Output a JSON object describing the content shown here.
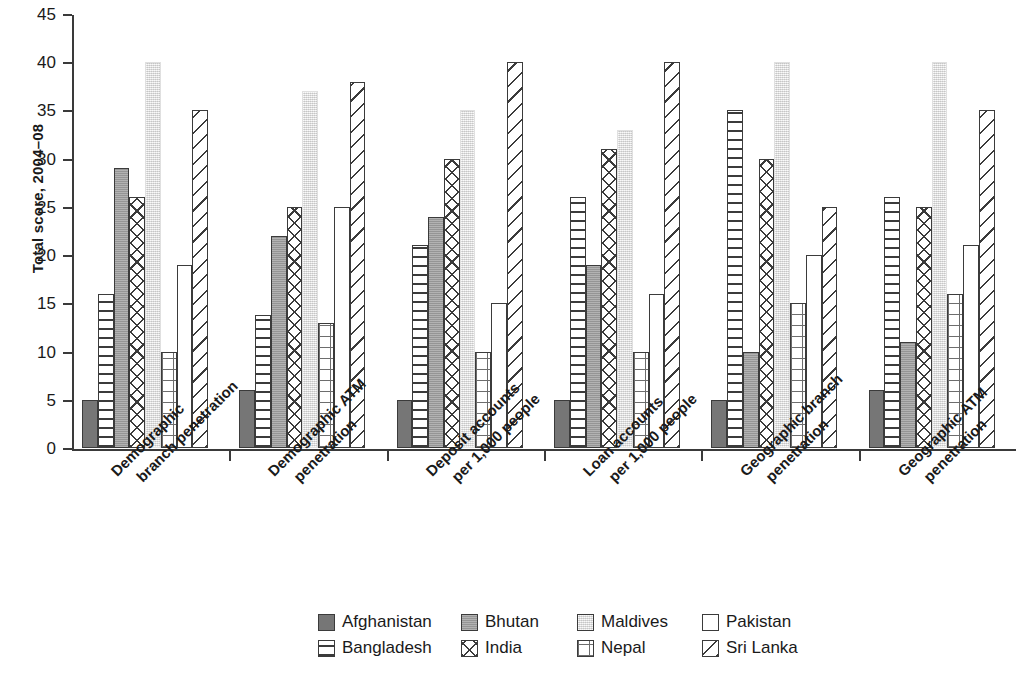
{
  "chart_data": {
    "type": "bar",
    "title": "",
    "xlabel": "",
    "ylabel": "Total score, 2004–08",
    "ylim": [
      0,
      45
    ],
    "ytick_values": [
      0,
      5,
      10,
      15,
      20,
      25,
      30,
      35,
      40,
      45
    ],
    "ytick_labels": [
      "0",
      "5",
      "10",
      "15",
      "20",
      "25",
      "30",
      "35",
      "40",
      "45"
    ],
    "grid": false,
    "legend_position": "bottom",
    "categories": [
      "Demographic branch penetration",
      "Demographic ATM penetration",
      "Deposit accounts per 1,000 people",
      "Loan accounts per 1,000 people",
      "Geographic branch penetration",
      "Geographic ATM penetration"
    ],
    "category_lines": [
      [
        "Demographic",
        "branch penetration"
      ],
      [
        "Demographic ATM",
        "penetration"
      ],
      [
        "Deposit accounts",
        "per 1,000 people"
      ],
      [
        "Loan accounts",
        "per 1,000 people"
      ],
      [
        "Geographic branch",
        "penetration"
      ],
      [
        "Geographic ATM",
        "penetration"
      ]
    ],
    "series": [
      {
        "name": "Afghanistan",
        "pattern": "solid-dark-gray",
        "color": "#767676",
        "values": [
          5,
          6,
          5,
          5,
          5,
          6
        ]
      },
      {
        "name": "Bangladesh",
        "pattern": "horizontal-lines",
        "color": "#ffffff",
        "values": [
          16,
          13.8,
          21,
          26,
          35,
          26
        ]
      },
      {
        "name": "Bhutan",
        "pattern": "solid-medium-gray",
        "color": "#9d9d9d",
        "values": [
          29,
          22,
          24,
          19,
          10,
          11
        ]
      },
      {
        "name": "India",
        "pattern": "cross-hatch",
        "color": "#ffffff",
        "values": [
          26,
          25,
          30,
          31,
          30,
          25
        ]
      },
      {
        "name": "Maldives",
        "pattern": "solid-light-gray",
        "color": "#e8e8e8",
        "values": [
          40,
          37,
          35,
          33,
          40,
          40
        ]
      },
      {
        "name": "Nepal",
        "pattern": "fine-grid",
        "color": "#ffffff",
        "values": [
          10,
          13,
          10,
          10,
          15,
          16
        ]
      },
      {
        "name": "Pakistan",
        "pattern": "empty-white",
        "color": "#ffffff",
        "values": [
          19,
          25,
          15,
          16,
          20,
          21
        ]
      },
      {
        "name": "Sri Lanka",
        "pattern": "diagonal-hatch",
        "color": "#ffffff",
        "values": [
          35,
          38,
          40,
          40,
          25,
          35
        ]
      }
    ]
  },
  "legend": {
    "row1": [
      "Afghanistan",
      "Bhutan",
      "Maldives",
      "Pakistan"
    ],
    "row2": [
      "Bangladesh",
      "India",
      "Nepal",
      "Sri Lanka"
    ]
  }
}
